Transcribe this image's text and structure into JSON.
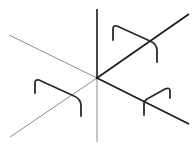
{
  "diagram": {
    "origin": [
      97,
      78
    ],
    "colors": {
      "background": "#ffffff",
      "positive_axis": "#1a1a1a",
      "negative_axis": "#8c8c8c",
      "bracket": "#2a2a2a"
    },
    "axes": [
      {
        "name": "axis-up-positive",
        "from": [
          97,
          78
        ],
        "to": [
          97,
          9
        ],
        "style": "dark",
        "width": 1.6
      },
      {
        "name": "axis-down-negative",
        "from": [
          97,
          78
        ],
        "to": [
          97,
          142
        ],
        "style": "light",
        "width": 1
      },
      {
        "name": "axis-upright-positive",
        "from": [
          97,
          78
        ],
        "to": [
          189,
          14
        ],
        "style": "dark",
        "width": 1.6
      },
      {
        "name": "axis-downleft-negative",
        "from": [
          97,
          78
        ],
        "to": [
          10,
          137
        ],
        "style": "light",
        "width": 1
      },
      {
        "name": "axis-downright-positive",
        "from": [
          97,
          78
        ],
        "to": [
          189,
          124
        ],
        "style": "dark",
        "width": 1.6
      },
      {
        "name": "axis-upleft-negative",
        "from": [
          97,
          78
        ],
        "to": [
          9,
          35
        ],
        "style": "light",
        "width": 1
      }
    ],
    "brackets": [
      {
        "name": "bracket-upper-right",
        "path": "M113,40 L113,29 Q113,25 117,26 L150,41 Q157,44 157,50 L157,62"
      },
      {
        "name": "bracket-lower-left",
        "path": "M35,93 L35,83 Q35,79 39,80 L74,96 Q81,99 81,106 L81,116"
      },
      {
        "name": "bracket-lower-right",
        "path": "M144,115 L144,104 Q144,101 147,99 L165,89 Q170,87 170,91 L170,98"
      }
    ]
  }
}
